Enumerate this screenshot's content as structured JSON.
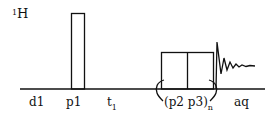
{
  "diagram": {
    "type": "NMR pulse sequence",
    "channel": {
      "mass": "1",
      "nucleus": "H"
    },
    "labels": {
      "d1": "d1",
      "p1": "p1",
      "t1_main": "t",
      "t1_sub": "1",
      "loop_main": "(p2 p3)",
      "loop_sub": "n",
      "aq": "aq"
    },
    "elements": [
      {
        "name": "d1",
        "kind": "delay"
      },
      {
        "name": "p1",
        "kind": "pulse"
      },
      {
        "name": "t1",
        "kind": "evolution delay"
      },
      {
        "name": "p2",
        "kind": "pulse",
        "loop": "n"
      },
      {
        "name": "p3",
        "kind": "pulse",
        "loop": "n"
      },
      {
        "name": "aq",
        "kind": "acquisition (FID)"
      }
    ],
    "colors": {
      "line": "#111111",
      "background": "#ffffff"
    }
  }
}
